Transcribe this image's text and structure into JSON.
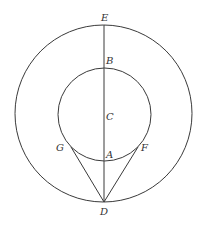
{
  "diagram": {
    "type": "geometry",
    "stroke_color": "#3a3a3a",
    "outer_circle": {
      "cx": 103.5,
      "cy": 113.5,
      "r": 88.5
    },
    "inner_circle": {
      "cx": 104.5,
      "cy": 114.5,
      "r": 46.5
    },
    "points": {
      "E": {
        "label": "E",
        "x": 104,
        "y": 25,
        "label_x": 101,
        "label_y": 21
      },
      "B": {
        "label": "B",
        "x": 104,
        "y": 68,
        "label_x": 106,
        "label_y": 64
      },
      "C": {
        "label": "C",
        "x": 104,
        "y": 114,
        "label_x": 106,
        "label_y": 120
      },
      "A": {
        "label": "A",
        "x": 104,
        "y": 161,
        "label_x": 106,
        "label_y": 158
      },
      "G": {
        "label": "G",
        "x": 71,
        "y": 147,
        "label_x": 56,
        "label_y": 151
      },
      "F": {
        "label": "F",
        "x": 138,
        "y": 147,
        "label_x": 141,
        "label_y": 151
      },
      "D": {
        "label": "D",
        "x": 104,
        "y": 202,
        "label_x": 100,
        "label_y": 215
      }
    },
    "segments": [
      {
        "from": "E",
        "to": "D"
      },
      {
        "from": "G",
        "to": "D"
      },
      {
        "from": "F",
        "to": "D"
      }
    ]
  }
}
